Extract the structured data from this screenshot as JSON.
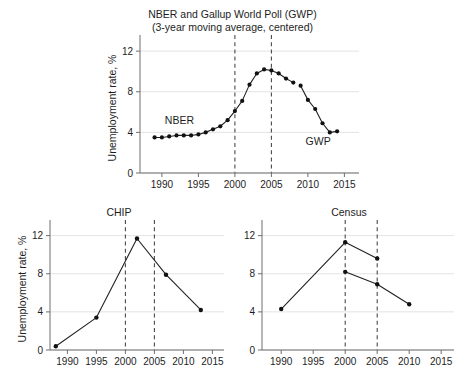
{
  "figure": {
    "background": "#ffffff",
    "ink_color": "#111111",
    "grid_color": "#e3e3e3",
    "axis_color": "#6e6e6e",
    "refline_color": "#4a4a4a"
  },
  "chart_data": [
    {
      "id": "nber-gwp",
      "type": "line",
      "title": "NBER and Gallup World Poll (GWP)",
      "subtitle": "(3-year moving average, centered)",
      "xlabel": "",
      "ylabel": "Unemployment rate, %",
      "xlim": [
        1987,
        2017
      ],
      "ylim": [
        0,
        12.8
      ],
      "xticks": [
        1990,
        1995,
        2000,
        2005,
        2010,
        2015
      ],
      "yticks": [
        0,
        4,
        8,
        12
      ],
      "grid": true,
      "legend_position": "inline-annotation",
      "reference_lines": [
        2000,
        2005
      ],
      "series": [
        {
          "name": "NBER",
          "annotation": "NBER",
          "annotation_x": 1992.4,
          "annotation_y": 4.85,
          "x": [
            1989,
            1990,
            1991,
            1992,
            1993,
            1994,
            1995,
            1996,
            1997,
            1998,
            1999,
            2000,
            2001,
            2002,
            2003,
            2004,
            2005,
            2006,
            2007,
            2008
          ],
          "values": [
            3.5,
            3.5,
            3.6,
            3.7,
            3.7,
            3.7,
            3.8,
            4.0,
            4.3,
            4.6,
            5.2,
            6.1,
            7.1,
            8.7,
            9.8,
            10.2,
            10.1,
            9.8,
            9.3,
            8.9
          ]
        },
        {
          "name": "GWP",
          "annotation": "GWP",
          "annotation_x": 2011.4,
          "annotation_y": 2.75,
          "x": [
            2009,
            2010,
            2011,
            2012,
            2013,
            2014
          ],
          "values": [
            8.6,
            7.2,
            6.3,
            4.9,
            4.0,
            4.1
          ]
        }
      ]
    },
    {
      "id": "chip",
      "type": "line",
      "title": "CHIP",
      "xlabel": "",
      "ylabel": "Unemployment rate, %",
      "xlim": [
        1987,
        2017
      ],
      "ylim": [
        0,
        12.8
      ],
      "xticks": [
        1990,
        1995,
        2000,
        2005,
        2010,
        2015
      ],
      "yticks": [
        0,
        4,
        8,
        12
      ],
      "grid": true,
      "reference_lines": [
        2000,
        2005
      ],
      "series": [
        {
          "name": "CHIP",
          "x": [
            1988,
            1995,
            2002,
            2007,
            2013
          ],
          "values": [
            0.4,
            3.4,
            11.7,
            7.9,
            4.2
          ]
        }
      ]
    },
    {
      "id": "census",
      "type": "line",
      "title": "Census",
      "xlabel": "",
      "ylabel": "",
      "xlim": [
        1987,
        2017
      ],
      "ylim": [
        0,
        12.8
      ],
      "xticks": [
        1990,
        1995,
        2000,
        2005,
        2010,
        2015
      ],
      "yticks": [
        0,
        4,
        8,
        12
      ],
      "grid": true,
      "reference_lines": [
        2000,
        2005
      ],
      "series": [
        {
          "name": "Census upper",
          "x": [
            1990,
            2000,
            2005
          ],
          "values": [
            4.3,
            11.3,
            9.6
          ]
        },
        {
          "name": "Census lower",
          "x": [
            2000,
            2005,
            2010
          ],
          "values": [
            8.2,
            6.9,
            4.8
          ]
        }
      ]
    }
  ]
}
